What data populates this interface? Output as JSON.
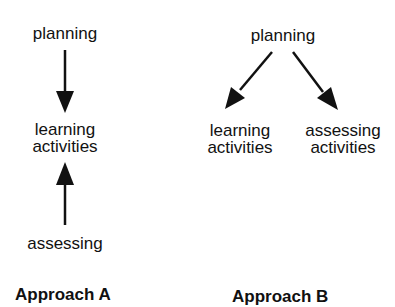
{
  "approach_a": {
    "top": "planning",
    "middle_line1": "learning",
    "middle_line2": "activities",
    "bottom": "assessing",
    "caption": "Approach A"
  },
  "approach_b": {
    "top": "planning",
    "left_line1": "learning",
    "left_line2": "activities",
    "right_line1": "assessing",
    "right_line2": "activities",
    "caption": "Approach B"
  }
}
